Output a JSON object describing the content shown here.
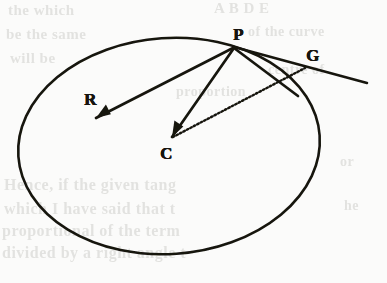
{
  "figure": {
    "kind": "geometry-diagram",
    "ink_color": "#16140f",
    "paper_color": "#fbfbfa",
    "bleed_color": "#cfcfcb",
    "labels": [
      {
        "id": "P",
        "text": "P",
        "x": 233,
        "y": 26,
        "role": "point-on-ellipse"
      },
      {
        "id": "G",
        "text": "G",
        "x": 306,
        "y": 47,
        "role": "external-point-on-tangent"
      },
      {
        "id": "R",
        "text": "R",
        "x": 84,
        "y": 91,
        "role": "interior-point"
      },
      {
        "id": "C",
        "text": "C",
        "x": 160,
        "y": 145,
        "role": "ellipse-centre"
      }
    ],
    "ellipse": {
      "cx": 169,
      "cy": 146,
      "rx": 151,
      "ry": 108,
      "rotation_deg": -4,
      "stroke_width": 2.6
    },
    "segments": [
      {
        "id": "PR",
        "from": "P",
        "to": "R",
        "style": "solid-arrow",
        "x1": 233,
        "y1": 48,
        "x2": 96,
        "y2": 118
      },
      {
        "id": "PC",
        "from": "P",
        "to": "C",
        "style": "solid-arrow",
        "x1": 234,
        "y1": 48,
        "x2": 172,
        "y2": 137
      },
      {
        "id": "CG",
        "from": "C",
        "to": "G",
        "style": "dotted",
        "x1": 173,
        "y1": 137,
        "x2": 305,
        "y2": 68
      },
      {
        "id": "PG-tangent",
        "from": "P",
        "to": "tangent-end",
        "style": "solid",
        "x1": 234,
        "y1": 47,
        "x2": 367,
        "y2": 83
      },
      {
        "id": "P-chord",
        "from": "P",
        "to": "ellipse-right",
        "style": "solid",
        "x1": 234,
        "y1": 48,
        "x2": 298,
        "y2": 96
      }
    ]
  },
  "bleed_text": {
    "lines": [
      {
        "text": "the which",
        "x": 8,
        "y": 2,
        "size": 15
      },
      {
        "text": "A B D E",
        "x": 214,
        "y": 0,
        "size": 15
      },
      {
        "text": "be the same",
        "x": 6,
        "y": 26,
        "size": 15
      },
      {
        "text": "of the curve",
        "x": 248,
        "y": 24,
        "size": 14
      },
      {
        "text": "will be",
        "x": 10,
        "y": 50,
        "size": 15
      },
      {
        "text": "centre of",
        "x": 268,
        "y": 62,
        "size": 14
      },
      {
        "text": "proportion",
        "x": 176,
        "y": 84,
        "size": 14
      },
      {
        "text": "Hence, if the given tang",
        "x": 4,
        "y": 176,
        "size": 16
      },
      {
        "text": "which I have said that t",
        "x": 4,
        "y": 200,
        "size": 16
      },
      {
        "text": "proportional of the term",
        "x": 2,
        "y": 222,
        "size": 16
      },
      {
        "text": "divided by a right angle t",
        "x": 2,
        "y": 244,
        "size": 16
      },
      {
        "text": "or",
        "x": 340,
        "y": 154,
        "size": 14
      },
      {
        "text": "he",
        "x": 344,
        "y": 198,
        "size": 14
      }
    ]
  }
}
